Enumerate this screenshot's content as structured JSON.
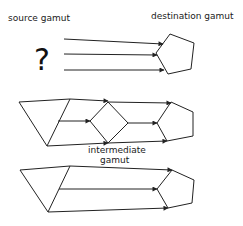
{
  "labels": {
    "source": "source gamut",
    "destination": "destination gamut",
    "intermediate_line1": "intermediate",
    "intermediate_line2": "gamut",
    "unknown_source": "?"
  },
  "rows": [
    {
      "name": "direct-unknown-source",
      "description": "unknown source gamut mapped directly to destination gamut",
      "arrows": 3
    },
    {
      "name": "via-intermediate",
      "description": "source gamut mapped to intermediate gamut, then to destination gamut",
      "arrows": 6
    },
    {
      "name": "direct-known-source",
      "description": "known source gamut mapped directly to destination gamut",
      "arrows": 3
    }
  ]
}
